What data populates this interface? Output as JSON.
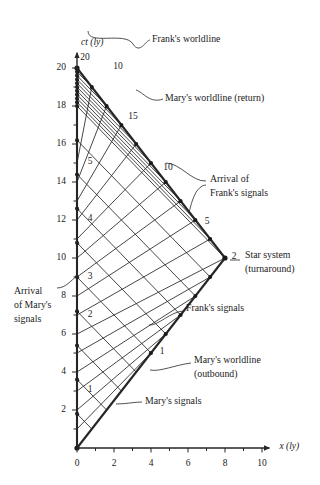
{
  "figure": {
    "axes": {
      "x": {
        "label": "x (ly)",
        "min": 0,
        "max": 10.4,
        "ticks": [
          0,
          1,
          2,
          3,
          4,
          5,
          6,
          7,
          8,
          9,
          10
        ],
        "tick_labels": [
          "0",
          "",
          "2",
          "",
          "4",
          "",
          "6",
          "",
          "8",
          "",
          "10"
        ]
      },
      "y": {
        "label": "ct (ly)",
        "min": 0,
        "max": 20.8,
        "ticks": [
          0,
          1,
          2,
          3,
          4,
          5,
          6,
          7,
          8,
          9,
          10,
          11,
          12,
          13,
          14,
          15,
          16,
          17,
          18,
          19,
          20
        ],
        "tick_labels": [
          "",
          "",
          "2",
          "",
          "4",
          "",
          "6",
          "",
          "8",
          "",
          "10",
          "",
          "12",
          "",
          "14",
          "",
          "16",
          "",
          "18",
          "",
          "20"
        ]
      }
    },
    "colors": {
      "ink": "#1a1a1a",
      "line": "#262626",
      "accent": "#333333"
    },
    "annotations": [
      {
        "name": "franks-worldline",
        "text": "Frank's worldline",
        "x": 152,
        "y": 40,
        "anchor": "start"
      },
      {
        "name": "marys-worldline-return",
        "text": "Mary's worldline (return)",
        "x": 165,
        "y": 99,
        "anchor": "start"
      },
      {
        "name": "arrival-of-franks-signals-l1",
        "text": "Arrival of",
        "x": 210,
        "y": 180,
        "anchor": "start"
      },
      {
        "name": "arrival-of-franks-signals-l2",
        "text": "Frank's signals",
        "x": 210,
        "y": 194,
        "anchor": "start"
      },
      {
        "name": "star-system-l1",
        "text": "Star system",
        "x": 245,
        "y": 256,
        "anchor": "start"
      },
      {
        "name": "star-system-l2",
        "text": "(turnaround)",
        "x": 245,
        "y": 270,
        "anchor": "start"
      },
      {
        "name": "franks-signals",
        "text": "Frank's signals",
        "x": 186,
        "y": 309,
        "anchor": "start"
      },
      {
        "name": "arrival-of-marys-signals-l1",
        "text": "Arrival",
        "x": 14,
        "y": 292,
        "anchor": "start"
      },
      {
        "name": "arrival-of-marys-signals-l2",
        "text": "of Mary's",
        "x": 14,
        "y": 306,
        "anchor": "start"
      },
      {
        "name": "arrival-of-marys-signals-l3",
        "text": "signals",
        "x": 14,
        "y": 320,
        "anchor": "start"
      },
      {
        "name": "marys-worldline-outbound-l1",
        "text": "Mary's worldline",
        "x": 194,
        "y": 361,
        "anchor": "start"
      },
      {
        "name": "marys-worldline-outbound-l2",
        "text": "(outbound)",
        "x": 194,
        "y": 375,
        "anchor": "start"
      },
      {
        "name": "marys-signals",
        "text": "Mary's signals",
        "x": 145,
        "y": 402,
        "anchor": "start"
      }
    ],
    "count_labels": [
      {
        "name": "frank-count-20",
        "text": "20",
        "x": 85,
        "y": 58
      },
      {
        "name": "mary-count-10-apex",
        "text": "10",
        "x": 118,
        "y": 67
      },
      {
        "name": "mary-count-15",
        "text": "15",
        "x": 133,
        "y": 117
      },
      {
        "name": "frank-count-5",
        "text": "5",
        "x": 90,
        "y": 162
      },
      {
        "name": "mary-count-10",
        "text": "10",
        "x": 168,
        "y": 168
      },
      {
        "name": "frank-count-4",
        "text": "4",
        "x": 90,
        "y": 219
      },
      {
        "name": "mary-count-5",
        "text": "5",
        "x": 207,
        "y": 222
      },
      {
        "name": "frank-count-3",
        "text": "3",
        "x": 90,
        "y": 277
      },
      {
        "name": "star-count-2",
        "text": "2",
        "x": 234,
        "y": 257
      },
      {
        "name": "frank-count-2",
        "text": "2",
        "x": 90,
        "y": 315
      },
      {
        "name": "mary-count-1",
        "text": "1",
        "x": 162,
        "y": 352
      },
      {
        "name": "frank-count-1",
        "text": "1",
        "x": 90,
        "y": 390
      }
    ]
  },
  "chart_data": {
    "type": "line",
    "xlabel": "x (ly)",
    "ylabel": "ct (ly)",
    "xlim": [
      0,
      10.4
    ],
    "ylim": [
      0,
      20.8
    ],
    "grid": false,
    "legend": "annotations",
    "geometry": {
      "origin_px": [
        77,
        448
      ],
      "px_per_ly_x": 18.5,
      "px_per_ly_y": 19.0
    },
    "series": [
      {
        "name": "Frank's worldline",
        "x": [
          0,
          0
        ],
        "ct": [
          0,
          20
        ],
        "style": "solid-thick"
      },
      {
        "name": "Mary's worldline (outbound)",
        "x": [
          0,
          8
        ],
        "ct": [
          0,
          10
        ],
        "style": "solid-thick"
      },
      {
        "name": "Mary's worldline (return)",
        "x": [
          8,
          0
        ],
        "ct": [
          10,
          20
        ],
        "style": "solid-thick"
      }
    ],
    "events": [
      {
        "name": "departure",
        "x": 0,
        "ct": 0
      },
      {
        "name": "turnaround (star system)",
        "x": 8,
        "ct": 10,
        "label": "2"
      },
      {
        "name": "reunion",
        "x": 0,
        "ct": 20,
        "label": "20"
      }
    ],
    "marys_signals_emitted": [
      {
        "n": 1,
        "emit_x": 0.8,
        "emit_ct": 1,
        "arrive_x": 0,
        "arrive_ct": 1.8
      },
      {
        "n": 2,
        "emit_x": 1.6,
        "emit_ct": 2,
        "arrive_x": 0,
        "arrive_ct": 3.6
      },
      {
        "n": 3,
        "emit_x": 2.4,
        "emit_ct": 3,
        "arrive_x": 0,
        "arrive_ct": 5.4
      },
      {
        "n": 4,
        "emit_x": 3.2,
        "emit_ct": 4,
        "arrive_x": 0,
        "arrive_ct": 7.2
      },
      {
        "n": 5,
        "emit_x": 4.0,
        "emit_ct": 5,
        "arrive_x": 0,
        "arrive_ct": 9.0
      },
      {
        "n": 6,
        "emit_x": 4.8,
        "emit_ct": 6,
        "arrive_x": 0,
        "arrive_ct": 10.8
      },
      {
        "n": 7,
        "emit_x": 5.6,
        "emit_ct": 7,
        "arrive_x": 0,
        "arrive_ct": 12.6
      },
      {
        "n": 8,
        "emit_x": 6.4,
        "emit_ct": 8,
        "arrive_x": 0,
        "arrive_ct": 14.4
      },
      {
        "n": 9,
        "emit_x": 7.2,
        "emit_ct": 9,
        "arrive_x": 0,
        "arrive_ct": 16.2
      },
      {
        "n": 10,
        "emit_x": 8.0,
        "emit_ct": 10,
        "arrive_x": 0,
        "arrive_ct": 18.0
      },
      {
        "n": 11,
        "emit_x": 7.2,
        "emit_ct": 11,
        "arrive_x": 0,
        "arrive_ct": 18.2
      },
      {
        "n": 12,
        "emit_x": 6.4,
        "emit_ct": 12,
        "arrive_x": 0,
        "arrive_ct": 18.4
      },
      {
        "n": 13,
        "emit_x": 5.6,
        "emit_ct": 13,
        "arrive_x": 0,
        "arrive_ct": 18.6
      },
      {
        "n": 14,
        "emit_x": 4.8,
        "emit_ct": 14,
        "arrive_x": 0,
        "arrive_ct": 18.8
      },
      {
        "n": 15,
        "emit_x": 4.0,
        "emit_ct": 15,
        "arrive_x": 0,
        "arrive_ct": 19.0
      },
      {
        "n": 16,
        "emit_x": 3.2,
        "emit_ct": 16,
        "arrive_x": 0,
        "arrive_ct": 19.2
      },
      {
        "n": 17,
        "emit_x": 2.4,
        "emit_ct": 17,
        "arrive_x": 0,
        "arrive_ct": 19.4
      },
      {
        "n": 18,
        "emit_x": 1.6,
        "emit_ct": 18,
        "arrive_x": 0,
        "arrive_ct": 19.6
      },
      {
        "n": 19,
        "emit_x": 0.8,
        "emit_ct": 19,
        "arrive_x": 0,
        "arrive_ct": 19.8
      }
    ],
    "franks_signals_emitted": [
      {
        "n": 1,
        "emit_x": 0,
        "emit_ct": 1,
        "arrive_x": 4.0,
        "arrive_ct": 5.0
      },
      {
        "n": 2,
        "emit_x": 0,
        "emit_ct": 2,
        "arrive_x": 4.8,
        "arrive_ct": 6.0
      },
      {
        "n": 3,
        "emit_x": 0,
        "emit_ct": 3,
        "arrive_x": 5.6,
        "arrive_ct": 7.0
      },
      {
        "n": 4,
        "emit_x": 0,
        "emit_ct": 4,
        "arrive_x": 6.4,
        "arrive_ct": 8.0
      },
      {
        "n": 5,
        "emit_x": 0,
        "emit_ct": 5,
        "arrive_x": 7.2,
        "arrive_ct": 9.0
      },
      {
        "n": 6,
        "emit_x": 0,
        "emit_ct": 6,
        "arrive_x": 8.0,
        "arrive_ct": 10.0
      },
      {
        "n": 7,
        "emit_x": 0,
        "emit_ct": 7,
        "arrive_x": 7.2,
        "arrive_ct": 11.0
      },
      {
        "n": 8,
        "emit_x": 0,
        "emit_ct": 8,
        "arrive_x": 6.4,
        "arrive_ct": 12.0
      },
      {
        "n": 9,
        "emit_x": 0,
        "emit_ct": 9,
        "arrive_x": 5.6,
        "arrive_ct": 13.0
      },
      {
        "n": 10,
        "emit_x": 0,
        "emit_ct": 10,
        "arrive_x": 4.8,
        "arrive_ct": 14.0
      },
      {
        "n": 11,
        "emit_x": 0,
        "emit_ct": 11,
        "arrive_x": 4.0,
        "arrive_ct": 15.0
      },
      {
        "n": 12,
        "emit_x": 0,
        "emit_ct": 12,
        "arrive_x": 3.2,
        "arrive_ct": 16.0
      },
      {
        "n": 13,
        "emit_x": 0,
        "emit_ct": 13,
        "arrive_x": 2.4,
        "arrive_ct": 17.0
      },
      {
        "n": 14,
        "emit_x": 0,
        "emit_ct": 14,
        "arrive_x": 1.6,
        "arrive_ct": 18.0
      },
      {
        "n": 15,
        "emit_x": 0,
        "emit_ct": 15,
        "arrive_x": 0.8,
        "arrive_ct": 19.0
      },
      {
        "n": 16,
        "emit_x": 0,
        "emit_ct": 16,
        "arrive_x": 0.0,
        "arrive_ct": 20.0
      },
      {
        "n": 17,
        "emit_x": 0,
        "emit_ct": 17,
        "arrive_x": 0.0,
        "arrive_ct": 20.0
      },
      {
        "n": 18,
        "emit_x": 0,
        "emit_ct": 18,
        "arrive_x": 0.0,
        "arrive_ct": 20.0
      },
      {
        "n": 19,
        "emit_x": 0,
        "emit_ct": 19,
        "arrive_x": 0.0,
        "arrive_ct": 20.0
      }
    ]
  },
  "leaders": [
    {
      "name": "leader-franks-worldline",
      "d": "M 88 31 C 88 46, 125 31, 133 44 C 140 55, 146 40, 150 40"
    },
    {
      "name": "leader-marys-worldline-return",
      "d": "M 136 90 C 143 92, 150 104, 163 99"
    },
    {
      "name": "leader-arrival-franks-signals-a",
      "d": "M 166 163 C 180 163, 192 182, 206 181"
    },
    {
      "name": "leader-arrival-franks-signals-b",
      "d": "M 189 213 C 192 200, 196 186, 206 185"
    },
    {
      "name": "leader-star-system",
      "d": "M 230 260 L 240 260"
    },
    {
      "name": "leader-franks-signals",
      "d": "M 149 325 C 158 326, 170 312, 183 311"
    },
    {
      "name": "leader-arrival-marys-signals",
      "d": "M 57 288 C 66 288, 71 280, 76 277"
    },
    {
      "name": "leader-marys-worldline-outbound",
      "d": "M 150 370 C 160 372, 175 365, 191 363"
    },
    {
      "name": "leader-marys-signals",
      "d": "M 116 404 C 126 404, 134 402, 142 402"
    }
  ]
}
